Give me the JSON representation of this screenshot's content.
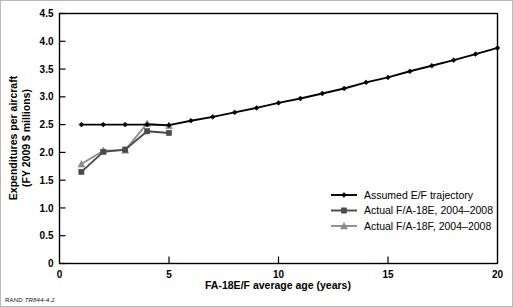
{
  "figure": {
    "source_note_prefix": "RAND",
    "source_note_code": "TR844-4.2"
  },
  "chart_data": {
    "type": "line",
    "title": "",
    "xlabel": "FA-18E/F average age (years)",
    "ylabel": "Expenditures per aircraft\n(FY 2009 $ millions)",
    "ylabel_line1": "Expenditures per aircraft",
    "ylabel_line2": "(FY 2009 $ millions)",
    "xlim": [
      0,
      20
    ],
    "ylim": [
      0,
      4.5
    ],
    "xticks": [
      0,
      5,
      10,
      15,
      20
    ],
    "xtick_labels": [
      "0",
      "5",
      "10",
      "15",
      "20"
    ],
    "yticks": [
      0,
      0.5,
      1.0,
      1.5,
      2.0,
      2.5,
      3.0,
      3.5,
      4.0,
      4.5
    ],
    "ytick_labels": [
      "0",
      "0.5",
      "1.0",
      "1.5",
      "2.0",
      "2.5",
      "3.0",
      "3.5",
      "4.0",
      "4.5"
    ],
    "grid": false,
    "legend_position": "lower right",
    "series": [
      {
        "name": "Assumed E/F trajectory",
        "color": "#000000",
        "marker": "diamond",
        "x": [
          1,
          2,
          3,
          4,
          5,
          6,
          7,
          8,
          9,
          10,
          11,
          12,
          13,
          14,
          15,
          16,
          17,
          18,
          19,
          20
        ],
        "values": [
          2.5,
          2.5,
          2.5,
          2.5,
          2.49,
          2.57,
          2.64,
          2.72,
          2.8,
          2.89,
          2.97,
          3.06,
          3.15,
          3.26,
          3.35,
          3.46,
          3.56,
          3.66,
          3.77,
          3.88
        ]
      },
      {
        "name": "Actual F/A-18E, 2004–2008",
        "color": "#4a4a4a",
        "marker": "square",
        "x": [
          1,
          2,
          3,
          4,
          5
        ],
        "values": [
          1.65,
          2.01,
          2.05,
          2.38,
          2.35
        ]
      },
      {
        "name": "Actual F/A-18F, 2004–2008",
        "color": "#8c8c8c",
        "marker": "triangle",
        "x": [
          1,
          2,
          3,
          4,
          5
        ],
        "values": [
          1.79,
          2.03,
          2.04,
          2.52,
          2.48
        ]
      }
    ],
    "legend": [
      "Assumed E/F trajectory",
      "Actual F/A-18E, 2004–2008",
      "Actual F/A-18F, 2004–2008"
    ]
  }
}
